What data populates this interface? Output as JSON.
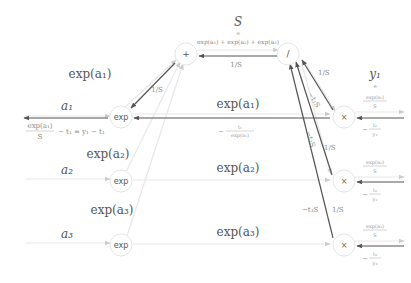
{
  "colors": {
    "forward_line": "#e8e8e8",
    "backward_line": "#555555",
    "node_border": "#e6e6e6",
    "text_dark": "#555555",
    "text_light": "#8a8a8a"
  },
  "nodes": {
    "exp1": {
      "label": "exp"
    },
    "exp2": {
      "label": "exp"
    },
    "exp3": {
      "label": "exp"
    },
    "sum": {
      "label": "+"
    },
    "div": {
      "label": "/"
    },
    "mul1": {
      "label": "×"
    },
    "mul2": {
      "label": "×"
    },
    "mul3": {
      "label": "×"
    }
  },
  "labels": {
    "S": "S",
    "S_equals": "=",
    "S_def": "exp(a₁) + exp(a₂) + exp(a₃)",
    "one_over_S_top": "1/S",
    "a1": "a₁",
    "a2": "a₂",
    "a3": "a₃",
    "exp_a1_left": "exp(a₁)",
    "exp_a2_left": "exp(a₂)",
    "exp_a3_left": "exp(a₃)",
    "exp_a1_mid": "exp(a₁)",
    "exp_a2_mid": "exp(a₂)",
    "exp_a3_mid": "exp(a₃)",
    "grad_a1_num": "exp(a₁)",
    "grad_a1_den": "S",
    "grad_a1_rest": "− t₁ = y₁ − t₁",
    "one_over_S_exp1": "1/S",
    "grad_mid_num": "t₁",
    "grad_mid_den": "exp(a₁)",
    "grad_mid_sign": "−",
    "y1": "y₁",
    "y1_equals": "=",
    "mul1_fwd_num": "exp(a₁)",
    "mul1_fwd_den": "S",
    "mul1_bwd_sign": "−",
    "mul1_bwd_num": "t₁",
    "mul1_bwd_den": "y₁",
    "mul2_fwd_num": "exp(a₂)",
    "mul2_fwd_den": "S",
    "mul2_bwd_sign": "−",
    "mul2_bwd_num": "t₂",
    "mul2_bwd_den": "y₂",
    "mul3_fwd_num": "exp(a₃)",
    "mul3_fwd_den": "S",
    "mul3_bwd_sign": "−",
    "mul3_bwd_num": "t₃",
    "mul3_bwd_den": "y₃",
    "diag1_over_S": "1/S",
    "diag1_t1S": "−t₁S",
    "diag2_t2S": "−t₂S",
    "diag2_over_S": "1/S",
    "diag3_t3S": "−t₃S",
    "diag3_over_S": "1/S"
  }
}
